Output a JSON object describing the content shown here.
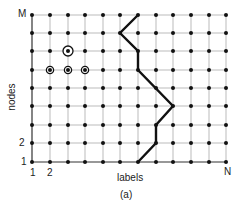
{
  "figure": {
    "caption": "(a)",
    "y_axis_label": "nodes",
    "x_axis_label": "labels",
    "y_ticks": {
      "top": "M",
      "second": "2",
      "first": "1"
    },
    "x_ticks": {
      "first": "1",
      "second": "2",
      "last": "N"
    },
    "grid": {
      "columns_x": [
        32,
        50,
        68,
        85,
        103,
        120,
        138,
        156,
        173,
        191,
        209,
        226
      ],
      "rows_y": [
        15,
        33,
        51,
        70,
        88,
        106,
        125,
        143,
        162
      ]
    },
    "path_points": [
      [
        138,
        162
      ],
      [
        156,
        143
      ],
      [
        156,
        125
      ],
      [
        173,
        106
      ],
      [
        138,
        70
      ],
      [
        138,
        51
      ],
      [
        120,
        33
      ],
      [
        138,
        15
      ]
    ],
    "highlighted_nodes": [
      {
        "x": 68,
        "y": 51,
        "style": "large-circle"
      },
      {
        "x": 50,
        "y": 70,
        "style": "small-circle"
      },
      {
        "x": 68,
        "y": 70,
        "style": "small-circle"
      },
      {
        "x": 85,
        "y": 70,
        "style": "small-circle"
      }
    ],
    "colors": {
      "grid": "#bbbbbb",
      "node": "#111111",
      "path": "#111111"
    }
  }
}
